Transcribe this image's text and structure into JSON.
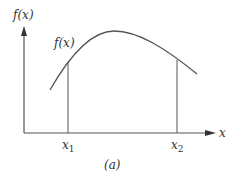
{
  "diagram": {
    "y_axis_label": "f(x)",
    "x_axis_label": "x",
    "curve_label": "f(x)",
    "x1_label": "x",
    "x1_sub": "1",
    "x2_label": "x",
    "x2_sub": "2",
    "caption": "(a)",
    "colors": {
      "line": "#555555",
      "text": "#333333"
    }
  }
}
